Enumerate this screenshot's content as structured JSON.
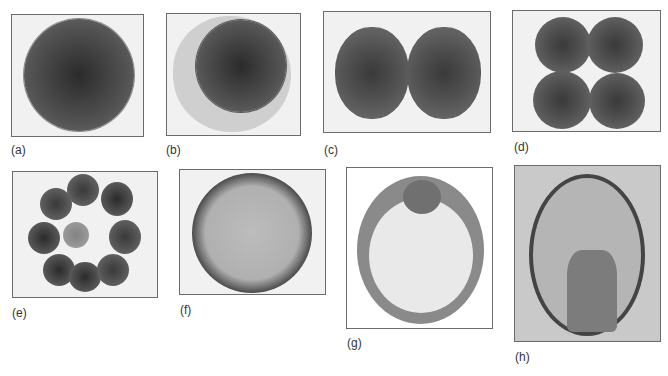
{
  "figure": {
    "panels": [
      {
        "id": "a",
        "label": "(a)",
        "description": "Fertilized egg (zygote)"
      },
      {
        "id": "b",
        "label": "(b)",
        "description": "Egg with fertilization envelope"
      },
      {
        "id": "c",
        "label": "(c)",
        "description": "Two-cell stage"
      },
      {
        "id": "d",
        "label": "(d)",
        "description": "Four-cell stage"
      },
      {
        "id": "e",
        "label": "(e)",
        "description": "Sixteen-cell stage (morula)"
      },
      {
        "id": "f",
        "label": "(f)",
        "description": "Blastula"
      },
      {
        "id": "g",
        "label": "(g)",
        "description": "Early gastrula"
      },
      {
        "id": "h",
        "label": "(h)",
        "description": "Late gastrula with archenteron"
      }
    ]
  }
}
